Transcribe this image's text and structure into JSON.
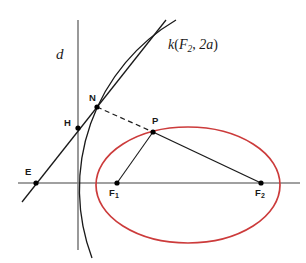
{
  "figure": {
    "width": 306,
    "height": 263,
    "background": "#ffffff"
  },
  "colors": {
    "ellipse": "#cc3b3b",
    "axis": "#808080",
    "directrix": "#808080",
    "curve": "#1a1a1a",
    "line": "#1a1a1a",
    "dashed": "#1a1a1a",
    "point": "#000000",
    "label": "#1a1a1a"
  },
  "labels": {
    "directrix": "d",
    "circle_k": {
      "name": "k",
      "open": "(",
      "focus": "F",
      "focus_sub": "2",
      "comma": ", ",
      "radius": "2a",
      "close": ")",
      "full": "k(F2, 2a)"
    },
    "point_E": "E",
    "point_H": "H",
    "point_N": "N",
    "point_P": "P",
    "point_F1": "F",
    "point_F1_sub": "1",
    "point_F2": "F",
    "point_F2_sub": "2"
  },
  "geometry": {
    "points": [
      {
        "name": "E",
        "x": 36,
        "y": 183
      },
      {
        "name": "H",
        "x": 78,
        "y": 128
      },
      {
        "name": "N",
        "x": 97,
        "y": 107
      },
      {
        "name": "P",
        "x": 153,
        "y": 132
      },
      {
        "name": "F1",
        "x": 117,
        "y": 183
      },
      {
        "name": "F2",
        "x": 261,
        "y": 183
      }
    ],
    "ellipse": {
      "cx": 188,
      "cy": 185,
      "rx": 92,
      "ry": 58
    },
    "axis": {
      "x1": 18,
      "y1": 183,
      "x2": 300,
      "y2": 183
    },
    "directrix": {
      "x1": 78,
      "y1": 20,
      "x2": 78,
      "y2": 250
    },
    "ray_E_N": {
      "x1": 22,
      "y1": 202,
      "x2": 166,
      "y2": 20
    },
    "circle_arc_k": {
      "from_x": 92,
      "from_y": 258,
      "to_x": 176,
      "to_y": 20,
      "radius": 196
    },
    "dashed_N_P": {
      "x1": 97,
      "y1": 107,
      "x2": 153,
      "y2": 132
    },
    "segment_P_F1": {
      "x1": 153,
      "y1": 132,
      "x2": 117,
      "y2": 183
    },
    "segment_P_F2": {
      "x1": 153,
      "y1": 132,
      "x2": 261,
      "y2": 183
    }
  },
  "label_positions": {
    "d": {
      "left": 56,
      "top": 47
    },
    "k": {
      "left": 168,
      "top": 38
    },
    "E": {
      "left": 25,
      "top": 167
    },
    "H": {
      "left": 64,
      "top": 118
    },
    "N": {
      "left": 89,
      "top": 93
    },
    "P": {
      "left": 152,
      "top": 116
    },
    "F1": {
      "left": 109,
      "top": 188
    },
    "F2": {
      "left": 255,
      "top": 188
    }
  }
}
